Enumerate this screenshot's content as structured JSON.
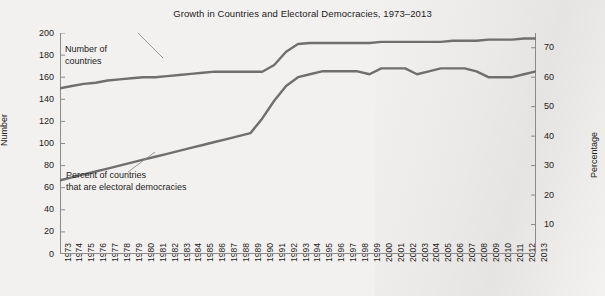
{
  "chart_data": {
    "type": "line",
    "title": "Growth in Countries and Electoral Democracies, 1973–2013",
    "xlabel": "",
    "ylabel": "Number",
    "y2label": "Percentage",
    "ylim": [
      0,
      200
    ],
    "y2lim": [
      0,
      75
    ],
    "yticks": [
      0,
      20,
      40,
      60,
      80,
      100,
      120,
      140,
      160,
      180,
      200
    ],
    "y2ticks": [
      10,
      20,
      30,
      40,
      50,
      60,
      70
    ],
    "grid": false,
    "legend_position": "inline-annotations",
    "x": [
      1973,
      1974,
      1975,
      1976,
      1977,
      1978,
      1979,
      1980,
      1981,
      1982,
      1983,
      1984,
      1985,
      1986,
      1987,
      1988,
      1989,
      1990,
      1991,
      1992,
      1993,
      1994,
      1995,
      1996,
      1997,
      1998,
      1999,
      2000,
      2001,
      2002,
      2003,
      2004,
      2005,
      2006,
      2007,
      2008,
      2009,
      2010,
      2011,
      2012,
      2013
    ],
    "xtick_labels": [
      "1973",
      "1974",
      "1975",
      "1976",
      "1977",
      "1978",
      "1979",
      "1980",
      "1981",
      "1982",
      "1983",
      "1984",
      "1985",
      "1986",
      "1987",
      "1988",
      "1989",
      "1990",
      "1991",
      "1992",
      "1993",
      "1994",
      "1995",
      "1996",
      "1997",
      "1998",
      "1999",
      "2000",
      "2001",
      "2002",
      "2003",
      "2004",
      "2005",
      "2006",
      "2007",
      "2008",
      "2009",
      "2010",
      "2011",
      "2012",
      "2013"
    ],
    "series": [
      {
        "name": "Number of countries",
        "axis": "left",
        "units": "count",
        "color": "#6f6f6f",
        "values": [
          150,
          152,
          154,
          155,
          157,
          158,
          159,
          160,
          160,
          161,
          162,
          163,
          164,
          165,
          165,
          165,
          165,
          165,
          171,
          183,
          190,
          191,
          191,
          191,
          191,
          191,
          191,
          192,
          192,
          192,
          192,
          192,
          192,
          193,
          193,
          193,
          194,
          194,
          194,
          195,
          195
        ]
      },
      {
        "name": "Percent of countries that are electoral democracies",
        "axis": "right",
        "units": "percent",
        "color": "#6f6f6f",
        "values": [
          25,
          26,
          27,
          28,
          29,
          30,
          31,
          32,
          33,
          34,
          35,
          36,
          37,
          38,
          39,
          40,
          41,
          46,
          52,
          57,
          60,
          61,
          62,
          62,
          62,
          62,
          61,
          63,
          63,
          63,
          61,
          62,
          63,
          63,
          63,
          62,
          60,
          60,
          60,
          61,
          62
        ]
      }
    ],
    "annotations": [
      {
        "id": "countries",
        "lines": [
          "Number of",
          "countries"
        ],
        "target_year": 1982
      },
      {
        "id": "percent",
        "lines": [
          "Percent of countries",
          "that are electoral democracies"
        ],
        "target_year": 1980
      }
    ]
  },
  "colors": {
    "background": "#f2f1ef",
    "line": "#6f6f6f",
    "axis": "#8a8a8a",
    "text": "#1d1a1b"
  }
}
